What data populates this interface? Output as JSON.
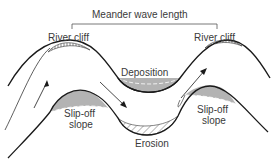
{
  "diagram": {
    "title": "Meander wave length",
    "labels": {
      "river_cliff_left": "River cliff",
      "river_cliff_right": "River cliff",
      "deposition": "Deposition",
      "slip_off_left_line1": "Slip-off",
      "slip_off_left_line2": "slope",
      "slip_off_right_line1": "Slip-off",
      "slip_off_right_line2": "slope",
      "erosion": "Erosion"
    },
    "colors": {
      "line": "#1a1a1a",
      "deposition_fill": "#b3b3b3",
      "text": "#3a3a3a",
      "background": "#ffffff"
    }
  }
}
